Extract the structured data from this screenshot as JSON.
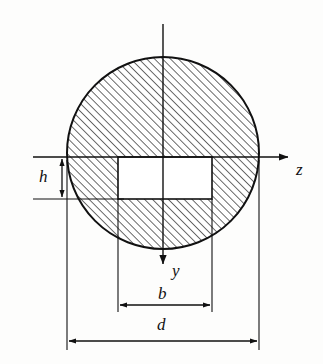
{
  "figure": {
    "background_color": "#fdfdfc",
    "stroke_color": "#111111",
    "hatch_color": "#333333",
    "hole_fill": "#ffffff"
  },
  "axes": {
    "z": {
      "label": "z",
      "direction": "right",
      "origin_x": 163,
      "origin_y": 157,
      "end_x": 292,
      "end_y": 157
    },
    "y": {
      "label": "y",
      "direction": "down",
      "origin_x": 163,
      "origin_y": 24,
      "end_x": 163,
      "end_y": 268
    }
  },
  "shapes": {
    "circle": {
      "name": "hatched-circle",
      "center_x": 163,
      "center_y": 153,
      "radius": 96,
      "hatched": true,
      "hatch_angle_deg": 45,
      "hatch_spacing_px": 4
    },
    "rectangle": {
      "name": "rectangular-hole",
      "left": 118,
      "top": 157,
      "right": 212,
      "bottom": 199,
      "width": 94,
      "height": 42,
      "hatched": false
    }
  },
  "dimensions": [
    {
      "name": "h",
      "label": "h",
      "orientation": "vertical",
      "line_x": 62,
      "from_y": 157,
      "to_y": 199,
      "label_x": 45,
      "label_y": 178
    },
    {
      "name": "b",
      "label": "b",
      "orientation": "horizontal",
      "line_y": 305,
      "from_x": 118,
      "to_x": 212,
      "label_x": 163,
      "label_y": 293
    },
    {
      "name": "d",
      "label": "d",
      "orientation": "horizontal",
      "line_y": 341,
      "from_x": 67,
      "to_x": 259,
      "label_x": 163,
      "label_y": 325
    }
  ]
}
